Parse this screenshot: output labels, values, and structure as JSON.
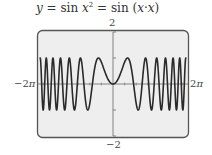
{
  "title": {
    "y": "y",
    "eq1": " = sin ",
    "x": "x",
    "sq": "2",
    "eq2": " = sin (",
    "x1": "x",
    "dot": "·",
    "x2": "x",
    "close": ")"
  },
  "axis_labels": {
    "ymax": "2",
    "ymin": "−2",
    "xmin_prefix": "−2",
    "xmax_prefix": "2",
    "pi": "π"
  },
  "colors": {
    "frame": "#555555",
    "background": "#eeeeee",
    "curve": "#2a2a2a",
    "axis": "#777777"
  },
  "chart_data": {
    "type": "line",
    "function": "sin(x^2)",
    "xlabel": "",
    "ylabel": "",
    "xlim": [
      -6.2832,
      6.2832
    ],
    "ylim": [
      -2,
      2
    ],
    "x_tick_labels": [
      "−2π",
      "2π"
    ],
    "y_tick_labels": [
      "−2",
      "2"
    ],
    "y_ticks": [
      -2,
      -1,
      1,
      2
    ],
    "grid": false,
    "legend": "none",
    "series": [
      {
        "name": "y = sin x²",
        "x": [
          -6.28,
          -5.5,
          -5.0,
          -4.5,
          -4.0,
          -3.5,
          -3.0,
          -2.5,
          -2.0,
          -1.5,
          -1.2533,
          -1.0,
          -0.5,
          0,
          0.5,
          1.0,
          1.2533,
          1.5,
          2.0,
          2.5,
          3.0,
          3.5,
          4.0,
          4.5,
          5.0,
          5.5,
          6.28
        ],
        "values": [
          -0.98,
          -0.46,
          -0.13,
          0.97,
          -0.29,
          -0.31,
          0.41,
          -0.03,
          -0.76,
          0.78,
          1.0,
          0.84,
          0.25,
          0,
          0.25,
          0.84,
          1.0,
          0.78,
          -0.76,
          -0.03,
          0.41,
          -0.31,
          -0.29,
          0.97,
          -0.13,
          -0.46,
          -0.98
        ]
      }
    ]
  }
}
